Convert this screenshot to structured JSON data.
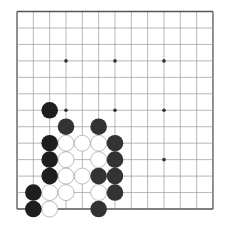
{
  "board": {
    "cols": 13,
    "rows": 13,
    "origin_x": 17,
    "origin_y": 11.5,
    "spacing_x": 16.33,
    "spacing_y": 16.46,
    "line_color": "#9a9a9a",
    "border_color": "#555555",
    "star_color": "#333333",
    "star_points": [
      [
        4,
        4
      ],
      [
        7,
        4
      ],
      [
        10,
        4
      ],
      [
        4,
        7
      ],
      [
        7,
        7
      ],
      [
        10,
        7
      ],
      [
        10,
        10
      ]
    ]
  },
  "stones": {
    "colors": {
      "black": "#1e1e1e",
      "dark": "#333333",
      "white": "#ffffff",
      "white_stroke": "#aaaaaa"
    },
    "black": [
      [
        3,
        7
      ],
      [
        4,
        8
      ],
      [
        6,
        8
      ],
      [
        3,
        9
      ],
      [
        7,
        9
      ],
      [
        3,
        10
      ],
      [
        7,
        10
      ],
      [
        3,
        11
      ],
      [
        6,
        11
      ],
      [
        7,
        11
      ],
      [
        2,
        12
      ],
      [
        7,
        12
      ],
      [
        2,
        13
      ],
      [
        6,
        13
      ]
    ],
    "white": [
      [
        4,
        9
      ],
      [
        5,
        9
      ],
      [
        6,
        9
      ],
      [
        4,
        10
      ],
      [
        6,
        10
      ],
      [
        4,
        11
      ],
      [
        5,
        11
      ],
      [
        3,
        12
      ],
      [
        4,
        12
      ],
      [
        6,
        12
      ],
      [
        3,
        13
      ]
    ]
  }
}
